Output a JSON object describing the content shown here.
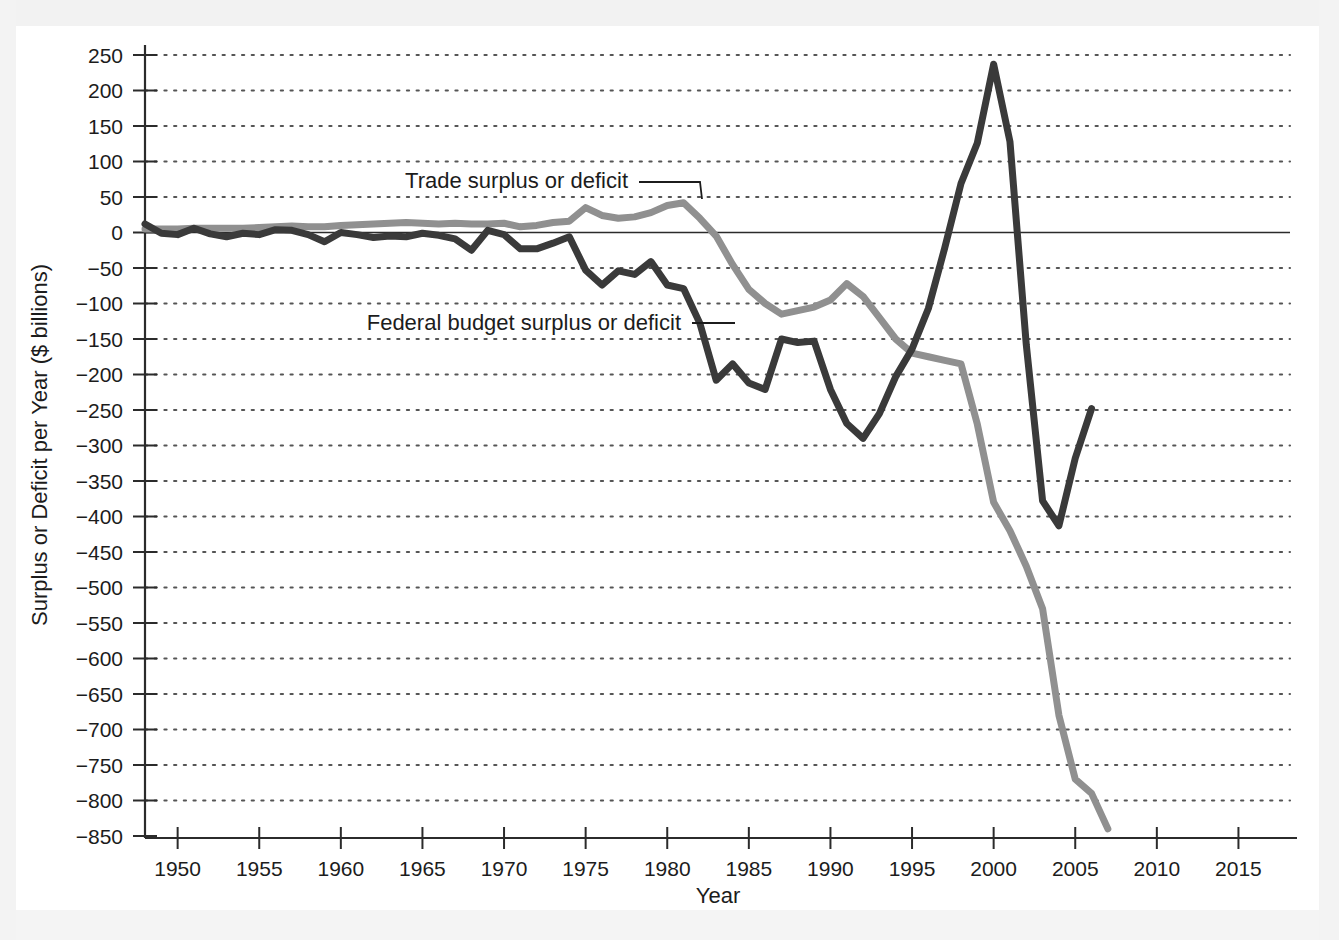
{
  "chart_data": {
    "type": "line",
    "title": "",
    "xlabel": "Year",
    "ylabel": "Surplus or Deficit per Year ($ billions)",
    "xlim": [
      1948,
      2016
    ],
    "ylim": [
      -850,
      250
    ],
    "grid": true,
    "grid_style": "dotted horizontal",
    "legend_position": "inline annotations with leader lines",
    "x_ticks": [
      1950,
      1955,
      1960,
      1965,
      1970,
      1975,
      1980,
      1985,
      1990,
      1995,
      2000,
      2005,
      2010,
      2015
    ],
    "x_tick_labels": [
      "1950",
      "1955",
      "1960",
      "1965",
      "1970",
      "1975",
      "1980",
      "1985",
      "1990",
      "1995",
      "2000",
      "2005",
      "2010",
      "2015"
    ],
    "y_ticks": [
      250,
      200,
      150,
      100,
      50,
      0,
      -50,
      -100,
      -150,
      -200,
      -250,
      -300,
      -350,
      -400,
      -450,
      -500,
      -550,
      -600,
      -650,
      -700,
      -750,
      -800,
      -850
    ],
    "y_tick_labels": [
      "250",
      "200",
      "150",
      "100",
      "50",
      "0",
      "−50",
      "−100",
      "−150",
      "−200",
      "−250",
      "−300",
      "−350",
      "−400",
      "−450",
      "−500",
      "−550",
      "−600",
      "−650",
      "−700",
      "−750",
      "−800",
      "−850"
    ],
    "zero_line": 0,
    "series": [
      {
        "name": "Trade surplus or deficit",
        "color": "#909090",
        "annotation": "Trade surplus or deficit",
        "x": [
          1948,
          1949,
          1950,
          1951,
          1952,
          1953,
          1954,
          1955,
          1956,
          1957,
          1958,
          1959,
          1960,
          1961,
          1962,
          1963,
          1964,
          1965,
          1966,
          1967,
          1968,
          1969,
          1970,
          1971,
          1972,
          1973,
          1974,
          1975,
          1976,
          1977,
          1978,
          1979,
          1980,
          1981,
          1982,
          1983,
          1984,
          1985,
          1986,
          1987,
          1988,
          1989,
          1990,
          1991,
          1992,
          1993,
          1994,
          1995,
          1996,
          1997,
          1998,
          1999,
          2000,
          2001,
          2002,
          2003,
          2004,
          2005,
          2006,
          2007
        ],
        "values": [
          5,
          5,
          5,
          6,
          6,
          6,
          6,
          7,
          8,
          9,
          8,
          8,
          10,
          11,
          12,
          13,
          14,
          13,
          12,
          13,
          12,
          12,
          13,
          8,
          10,
          14,
          16,
          35,
          24,
          20,
          22,
          28,
          38,
          42,
          20,
          -5,
          -45,
          -80,
          -100,
          -115,
          -110,
          -105,
          -95,
          -72,
          -90,
          -120,
          -150,
          -170,
          -175,
          -180,
          -185,
          -270,
          -380,
          -420,
          -470,
          -530,
          -680,
          -770,
          -790,
          -840
        ],
        "endpoint_note": "series ends around 2007 near -840"
      },
      {
        "name": "Federal budget surplus or deficit",
        "color": "#3a3a3a",
        "annotation": "Federal budget surplus or deficit",
        "x": [
          1948,
          1949,
          1950,
          1951,
          1952,
          1953,
          1954,
          1955,
          1956,
          1957,
          1958,
          1959,
          1960,
          1961,
          1962,
          1963,
          1964,
          1965,
          1966,
          1967,
          1968,
          1969,
          1970,
          1971,
          1972,
          1973,
          1974,
          1975,
          1976,
          1977,
          1978,
          1979,
          1980,
          1981,
          1982,
          1983,
          1984,
          1985,
          1986,
          1987,
          1988,
          1989,
          1990,
          1991,
          1992,
          1993,
          1994,
          1995,
          1996,
          1997,
          1998,
          1999,
          2000,
          2001,
          2002,
          2003,
          2004,
          2005,
          2006
        ],
        "values": [
          12,
          -1,
          -3,
          6,
          -2,
          -6,
          -1,
          -3,
          4,
          3,
          -3,
          -13,
          0,
          -3,
          -7,
          -5,
          -6,
          -1,
          -4,
          -9,
          -25,
          3,
          -3,
          -23,
          -23,
          -15,
          -6,
          -53,
          -74,
          -54,
          -59,
          -41,
          -74,
          -79,
          -128,
          -208,
          -185,
          -212,
          -221,
          -150,
          -155,
          -153,
          -221,
          -269,
          -290,
          -255,
          -203,
          -164,
          -107,
          -22,
          69,
          126,
          237,
          128,
          -158,
          -378,
          -413,
          -318,
          -248
        ],
        "endpoint_note": "series ends around 2006 near -248",
        "peak": {
          "year": 2000,
          "value": 237
        },
        "trough": {
          "year": 2004,
          "value": -413
        }
      }
    ]
  },
  "axes": {
    "x_axis_title": "Year",
    "y_axis_title": "Surplus or Deficit per Year ($ billions)"
  },
  "annotations": {
    "trade_label": "Trade surplus or deficit",
    "budget_label": "Federal budget surplus or deficit"
  }
}
